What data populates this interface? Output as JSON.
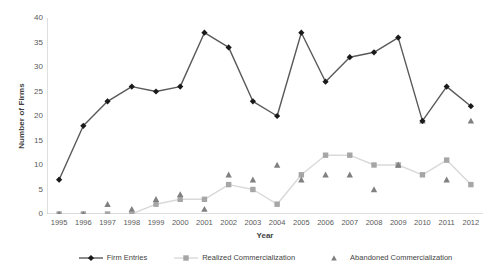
{
  "chart_data": {
    "type": "line",
    "title": "",
    "xlabel": "Year",
    "ylabel": "Number of Firms",
    "categories": [
      "1995",
      "1996",
      "1997",
      "1998",
      "1999",
      "2000",
      "2001",
      "2002",
      "2003",
      "2004",
      "2005",
      "2006",
      "2007",
      "2008",
      "2009",
      "2010",
      "2011",
      "2012"
    ],
    "x": [
      1995,
      1996,
      1997,
      1998,
      1999,
      2000,
      2001,
      2002,
      2003,
      2004,
      2005,
      2006,
      2007,
      2008,
      2009,
      2010,
      2011,
      2012
    ],
    "ylim": [
      0,
      40
    ],
    "y_ticks": [
      0,
      5,
      10,
      15,
      20,
      25,
      30,
      35,
      40
    ],
    "grid": false,
    "legend_position": "bottom",
    "series": [
      {
        "name": "Firm Entries",
        "color": "#595959",
        "marker": "diamond",
        "marker_color": "#1a1a1a",
        "values": [
          7,
          18,
          23,
          26,
          25,
          26,
          37,
          34,
          23,
          20,
          37,
          27,
          32,
          33,
          36,
          19,
          26,
          22
        ]
      },
      {
        "name": "Realized Commercialization",
        "color": "#d9d9d9",
        "marker": "square",
        "marker_color": "#a6a6a6",
        "values": [
          0,
          0,
          0,
          0,
          2,
          3,
          3,
          6,
          5,
          2,
          8,
          12,
          12,
          10,
          10,
          8,
          11,
          6
        ]
      },
      {
        "name": "Abandoned Commercialization",
        "color": "none",
        "marker": "triangle",
        "marker_color": "#808080",
        "values": [
          0,
          0,
          2,
          1,
          3,
          4,
          1,
          8,
          7,
          10,
          7,
          8,
          8,
          5,
          10,
          19,
          7,
          19
        ]
      }
    ]
  },
  "axis": {
    "y_title": "Number of Firms",
    "x_title": "Year"
  },
  "legend": {
    "items": [
      {
        "label": "Firm Entries"
      },
      {
        "label": "Realized Commercialization"
      },
      {
        "label": "Abandoned Commercialization"
      }
    ]
  },
  "colors": {
    "firm_entries_line": "#595959",
    "firm_entries_marker": "#1a1a1a",
    "realized_line": "#d9d9d9",
    "realized_marker": "#a6a6a6",
    "abandoned_marker": "#808080",
    "axis": "#bfbfbf",
    "text": "#3f3f3f",
    "background": "#ffffff"
  }
}
